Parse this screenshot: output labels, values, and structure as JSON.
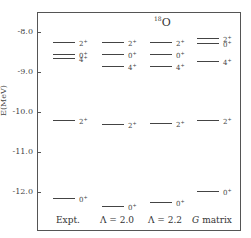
{
  "chart_data": {
    "type": "level-scheme",
    "title": "18O",
    "title_parts": {
      "mass": "18",
      "element": "O"
    },
    "ylabel": "E(MeV)",
    "ylim": [
      -12.9,
      -7.5
    ],
    "yticks": [
      -8.0,
      -9.0,
      -10.0,
      -11.0,
      -12.0
    ],
    "ytick_labels": [
      "-8.0",
      "-9.0",
      "-10.0",
      "-11.0",
      "-12.0"
    ],
    "columns": [
      {
        "name": "Expt.",
        "levels": [
          {
            "J": "2+",
            "E": -8.25
          },
          {
            "J": "0+",
            "E": -8.55
          },
          {
            "J": "4+",
            "E": -8.65
          },
          {
            "J": "2+",
            "E": -10.2
          },
          {
            "J": "0+",
            "E": -12.15
          }
        ]
      },
      {
        "name": "Λ = 2.0",
        "levels": [
          {
            "J": "2+",
            "E": -8.25
          },
          {
            "J": "0+",
            "E": -8.55
          },
          {
            "J": "4+",
            "E": -8.85
          },
          {
            "J": "2+",
            "E": -10.3
          },
          {
            "J": "0+",
            "E": -12.35
          }
        ]
      },
      {
        "name": "Λ = 2.2",
        "levels": [
          {
            "J": "2+",
            "E": -8.25
          },
          {
            "J": "0+",
            "E": -8.55
          },
          {
            "J": "4+",
            "E": -8.85
          },
          {
            "J": "2+",
            "E": -10.28
          },
          {
            "J": "0+",
            "E": -12.25
          }
        ]
      },
      {
        "name": "G matrix",
        "levels": [
          {
            "J": "2+",
            "E": -8.15
          },
          {
            "J": "0+",
            "E": -8.28
          },
          {
            "J": "4+",
            "E": -8.72
          },
          {
            "J": "2+",
            "E": -10.2
          },
          {
            "J": "0+",
            "E": -11.98
          }
        ]
      }
    ],
    "legend": null,
    "grid": false
  }
}
